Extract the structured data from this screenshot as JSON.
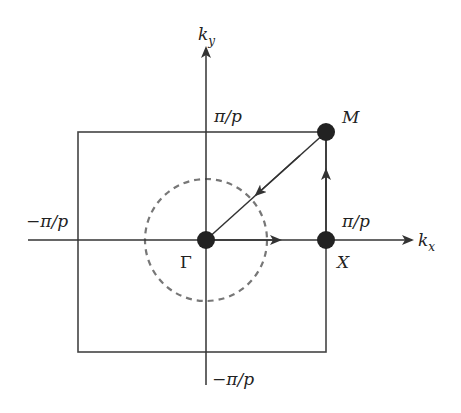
{
  "diagram": {
    "colors": {
      "line": "#333333",
      "point": "#222222",
      "dashed_circle": "#777777",
      "background": "#ffffff"
    },
    "axes": {
      "kx": {
        "label": "k",
        "subscript": "x"
      },
      "ky": {
        "label": "k",
        "subscript": "y"
      }
    },
    "tick_labels": {
      "ky_pos": "π/p",
      "ky_neg": "−π/p",
      "kx_pos": "π/p",
      "kx_neg": "−π/p"
    },
    "points": {
      "gamma": "Γ",
      "x": "X",
      "m": "M"
    },
    "path": [
      "Γ",
      "X",
      "M",
      "Γ"
    ]
  }
}
